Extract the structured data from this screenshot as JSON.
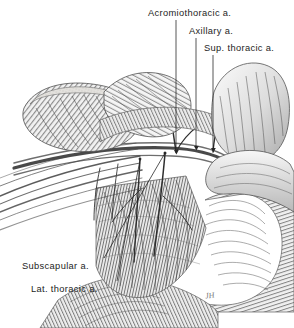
{
  "plate": {
    "title": "Branches of the axillary artery",
    "width": 294,
    "height": 328,
    "background_color": "#ffffff",
    "ink_color": "#1d1d1d",
    "medium": "pen-and-ink stipple and line engraving, grayscale"
  },
  "labels": [
    {
      "id": "acromiothoracic",
      "text": "Acromiothoracic a.",
      "x": 148,
      "y": 9,
      "anchor": "left"
    },
    {
      "id": "axillary",
      "text": "Axillary a.",
      "x": 189,
      "y": 27,
      "anchor": "left"
    },
    {
      "id": "supthoracic",
      "text": "Sup. thoracic a.",
      "x": 204,
      "y": 44,
      "anchor": "left"
    },
    {
      "id": "subscapular",
      "text": "Subscapular a.",
      "x": 22,
      "y": 262,
      "anchor": "left"
    },
    {
      "id": "latthoracic",
      "text": "Lat. thoracic a.",
      "x": 31,
      "y": 285,
      "anchor": "left"
    }
  ],
  "signature": {
    "text": "JH",
    "x": 205,
    "y": 291
  },
  "caption": {
    "text": ""
  },
  "leaders": [
    {
      "for": "acromiothoracic",
      "path": "M176,20 L176,152",
      "tip": "arrow-down"
    },
    {
      "for": "axillary",
      "path": "M196,38 L196,148",
      "tip": "arrow-down"
    },
    {
      "for": "supthoracic",
      "path": "M213,55 L213,150",
      "tip": "arrow-down"
    },
    {
      "for": "subscapular",
      "path": "M104,259 L165,152",
      "tip": "plain"
    },
    {
      "for": "latthoracic",
      "path": "M117,282 L140,160",
      "tip": "plain"
    }
  ],
  "structures": [
    {
      "name": "pectoralis-major-cut-end",
      "region": "upper-left"
    },
    {
      "name": "pectoralis-minor-cut-end",
      "region": "upper-center"
    },
    {
      "name": "deltoid-muscle",
      "region": "upper-right"
    },
    {
      "name": "biceps-and-arm-mass",
      "region": "right"
    },
    {
      "name": "serratus-anterior-and-ribs",
      "region": "lower-center"
    },
    {
      "name": "latissimus-dorsi-border",
      "region": "lower-right"
    },
    {
      "name": "clavipectoral-fascia-bands",
      "region": "left"
    }
  ]
}
